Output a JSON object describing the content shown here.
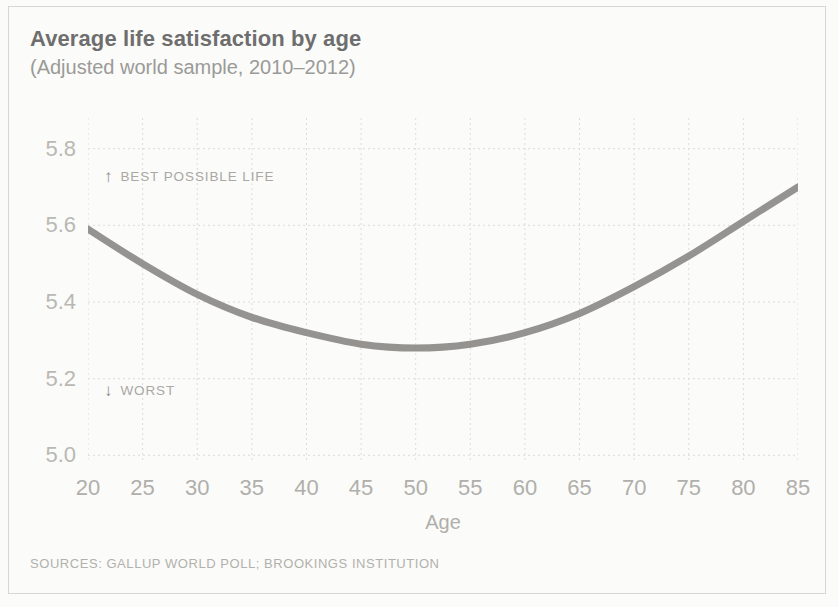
{
  "header": {
    "title": "Average life satisfaction by age",
    "subtitle": "(Adjusted world sample, 2010–2012)"
  },
  "footer": {
    "sources": "SOURCES: GALLUP WORLD POLL; BROOKINGS INSTITUTION"
  },
  "annotations": {
    "best": {
      "arrow": "↑",
      "label": "BEST POSSIBLE LIFE"
    },
    "worst": {
      "arrow": "↓",
      "label": "WORST"
    }
  },
  "colors": {
    "curve": "#8b8a86",
    "grid": "#dedcd8",
    "tick_text": "#b4b3af",
    "title_text": "#6e6e6e",
    "subtitle_text": "#9a9a98",
    "background": "#fbfbf9",
    "frame": "#d8d6d2"
  },
  "chart_data": {
    "type": "line",
    "title": "Average life satisfaction by age",
    "subtitle": "(Adjusted world sample, 2010–2012)",
    "xlabel": "Age",
    "ylabel": "",
    "xlim": [
      20,
      85
    ],
    "ylim": [
      4.98,
      5.88
    ],
    "xticks": [
      20,
      25,
      30,
      35,
      40,
      45,
      50,
      55,
      60,
      65,
      70,
      75,
      80,
      85
    ],
    "xticklabels": [
      "20",
      "25",
      "30",
      "35",
      "40",
      "45",
      "50",
      "55",
      "60",
      "65",
      "70",
      "75",
      "80",
      "85"
    ],
    "yticks": [
      5.0,
      5.2,
      5.4,
      5.6,
      5.8
    ],
    "yticklabels": [
      "5.0",
      "5.2",
      "5.4",
      "5.6",
      "5.8"
    ],
    "grid": true,
    "grid_style": "dashed",
    "legend": null,
    "series": [
      {
        "name": "Average life satisfaction",
        "color": "#8b8a86",
        "x": [
          20,
          25,
          30,
          35,
          40,
          45,
          50,
          55,
          60,
          65,
          70,
          75,
          80,
          85
        ],
        "values": [
          5.59,
          5.5,
          5.42,
          5.36,
          5.32,
          5.29,
          5.28,
          5.29,
          5.32,
          5.37,
          5.44,
          5.52,
          5.61,
          5.7
        ]
      }
    ],
    "annotations": [
      {
        "text": "↑ BEST POSSIBLE LIFE",
        "x": 21.5,
        "y": 5.65
      },
      {
        "text": "↓ WORST",
        "x": 21.5,
        "y": 5.07
      }
    ],
    "source": "SOURCES: GALLUP WORLD POLL; BROOKINGS INSTITUTION"
  }
}
